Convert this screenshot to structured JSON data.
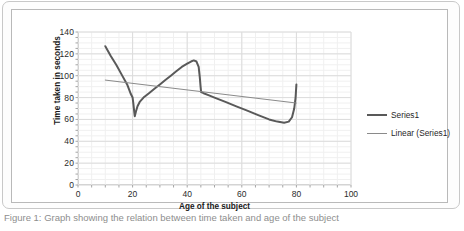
{
  "figure": {
    "caption": "Figure 1: Graph showing the relation between time taken and age of the subject"
  },
  "chart_data": {
    "type": "line",
    "title": "",
    "subtitle": "",
    "xlabel": "Age of the subject",
    "ylabel": "Time taken in seconds",
    "xlim": [
      0,
      100
    ],
    "ylim": [
      0,
      140
    ],
    "xticks": [
      0,
      20,
      40,
      60,
      80,
      100
    ],
    "yticks": [
      0,
      20,
      40,
      60,
      80,
      100,
      120,
      140
    ],
    "xtick_labels": [
      "0",
      "20",
      "40",
      "60",
      "80",
      "100"
    ],
    "ytick_labels": [
      "0",
      "20",
      "40",
      "60",
      "80",
      "100",
      "120",
      "140"
    ],
    "grid": true,
    "grid_minor": true,
    "legend_position": "right",
    "series": [
      {
        "name": "Series1",
        "type": "line",
        "color": "#595959",
        "width": 2,
        "points": [
          [
            10.0,
            127
          ],
          [
            12.0,
            118
          ],
          [
            14.0,
            110
          ],
          [
            16.0,
            101
          ],
          [
            18.0,
            92
          ],
          [
            19.4,
            83
          ],
          [
            20.0,
            80
          ],
          [
            20.3,
            74
          ],
          [
            20.6,
            67
          ],
          [
            20.8,
            63
          ],
          [
            21.2,
            67
          ],
          [
            21.8,
            72
          ],
          [
            22.6,
            76
          ],
          [
            24.0,
            80
          ],
          [
            26.0,
            84
          ],
          [
            28.0,
            88
          ],
          [
            30.0,
            92
          ],
          [
            32.0,
            96
          ],
          [
            34.0,
            100
          ],
          [
            36.0,
            104
          ],
          [
            38.0,
            108
          ],
          [
            40.0,
            111
          ],
          [
            41.4,
            113
          ],
          [
            42.4,
            114
          ],
          [
            43.4,
            113
          ],
          [
            44.2,
            108
          ],
          [
            44.6,
            99
          ],
          [
            44.9,
            90
          ],
          [
            45.1,
            85
          ],
          [
            46.0,
            84
          ],
          [
            48.0,
            82
          ],
          [
            50.0,
            80
          ],
          [
            54.0,
            76
          ],
          [
            58.0,
            72
          ],
          [
            62.0,
            68
          ],
          [
            66.0,
            64
          ],
          [
            70.0,
            60
          ],
          [
            73.0,
            58
          ],
          [
            75.5,
            57
          ],
          [
            77.2,
            58
          ],
          [
            78.4,
            62
          ],
          [
            79.2,
            70
          ],
          [
            79.7,
            80
          ],
          [
            80.0,
            92
          ]
        ]
      },
      {
        "name": "Linear (Series1)",
        "type": "trendline",
        "color": "#8a8a8a",
        "width": 1,
        "points": [
          [
            10.0,
            96
          ],
          [
            80.0,
            75
          ]
        ]
      }
    ]
  }
}
